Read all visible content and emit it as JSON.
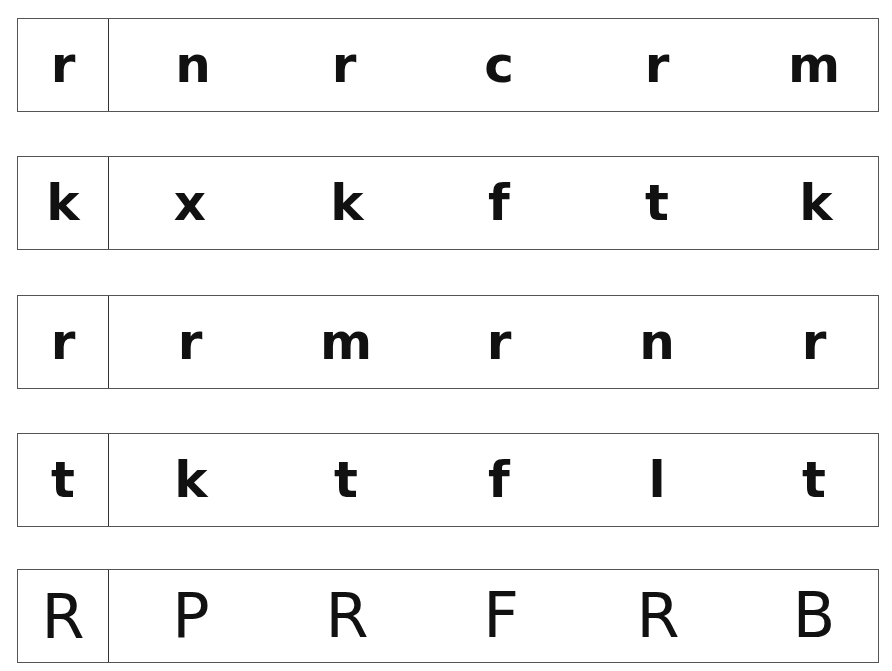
{
  "worksheet": {
    "rows": [
      {
        "key": "r",
        "choices": [
          "n",
          "r",
          "c",
          "r",
          "m"
        ]
      },
      {
        "key": "k",
        "choices": [
          "x",
          "k",
          "f",
          "t",
          "k"
        ]
      },
      {
        "key": "r",
        "choices": [
          "r",
          "m",
          "r",
          "n",
          "r"
        ]
      },
      {
        "key": "t",
        "choices": [
          "k",
          "t",
          "f",
          "l",
          "t"
        ]
      },
      {
        "key": "R",
        "choices": [
          "P",
          "R",
          "F",
          "R",
          "B"
        ]
      }
    ]
  }
}
